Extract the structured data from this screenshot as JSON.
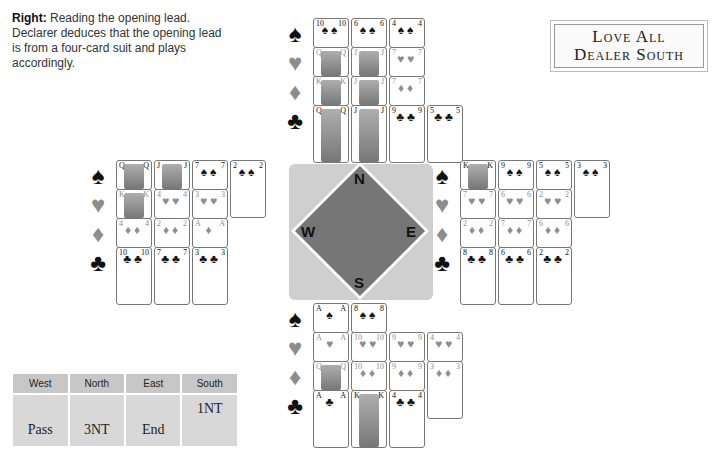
{
  "caption": {
    "lead": "Right:",
    "text": " Reading the opening lead. Declarer deduces that the opening lead is from a four-card suit and plays accordingly."
  },
  "vulnerability": {
    "line1": "Love All",
    "line2": "Dealer South"
  },
  "suits": {
    "spades": {
      "symbol": "♠",
      "color": "#111111"
    },
    "hearts": {
      "symbol": "♥",
      "color": "#8d8d8d"
    },
    "diamonds": {
      "symbol": "♦",
      "color": "#8d8d8d"
    },
    "clubs": {
      "symbol": "♣",
      "color": "#111111"
    }
  },
  "hands": {
    "north": {
      "spades": [
        "10",
        "6",
        "4"
      ],
      "hearts": [
        "Q",
        "J",
        "7"
      ],
      "diamonds": [
        "K",
        "J",
        "7"
      ],
      "clubs": [
        "Q",
        "J",
        "9",
        "5"
      ]
    },
    "west": {
      "spades": [
        "Q",
        "J",
        "7",
        "2"
      ],
      "hearts": [
        "K",
        "4",
        "3"
      ],
      "diamonds": [
        "4",
        "2",
        "A"
      ],
      "clubs": [
        "10",
        "7",
        "3"
      ]
    },
    "east": {
      "spades": [
        "K",
        "9",
        "5",
        "3"
      ],
      "hearts": [
        "7",
        "6",
        "2"
      ],
      "diamonds": [
        "2",
        "7",
        "6"
      ],
      "clubs": [
        "8",
        "6",
        "2"
      ]
    },
    "south": {
      "spades": [
        "A",
        "8"
      ],
      "hearts": [
        "A",
        "10",
        "9",
        "4"
      ],
      "diamonds": [
        "Q",
        "10",
        "9",
        "3"
      ],
      "clubs": [
        "A",
        "K",
        "4"
      ]
    }
  },
  "compass": {
    "n": "N",
    "s": "S",
    "e": "E",
    "w": "W"
  },
  "bidding": {
    "headers": [
      "West",
      "North",
      "East",
      "South"
    ],
    "rows": [
      [
        "",
        "",
        "",
        "1NT"
      ],
      [
        "Pass",
        "3NT",
        "End",
        ""
      ]
    ]
  }
}
